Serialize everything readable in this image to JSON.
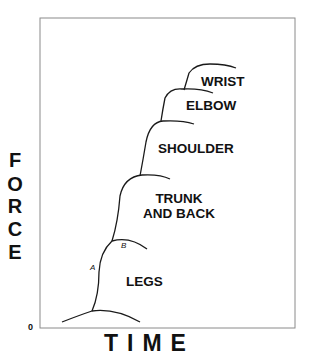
{
  "diagram": {
    "title": "",
    "axes": {
      "y_label_letters": [
        "F",
        "O",
        "R",
        "C",
        "E"
      ],
      "x_label": "TIME",
      "origin_label": "0"
    },
    "segments": [
      {
        "name": "legs",
        "label": "LEGS"
      },
      {
        "name": "trunk-and-back",
        "label_line1": "TRUNK",
        "label_line2": "AND BACK"
      },
      {
        "name": "shoulder",
        "label": "SHOULDER"
      },
      {
        "name": "elbow",
        "label": "ELBOW"
      },
      {
        "name": "wrist",
        "label": "WRIST"
      }
    ],
    "point_labels": {
      "a": "A",
      "b": "B"
    },
    "colors": {
      "line": "#1a1a1a",
      "frame": "#8a8a8a",
      "background": "#ffffff"
    }
  }
}
